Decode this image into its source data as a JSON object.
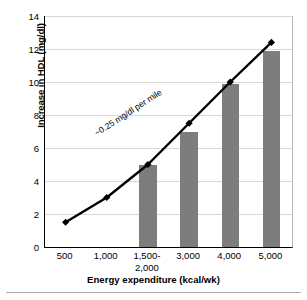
{
  "chart_data": {
    "type": "bar",
    "title": "",
    "subtitle": "",
    "xlabel": "Energy expenditure (kcal/wk)",
    "ylabel": "Increase in HDL (mg/dl)",
    "categories": [
      "500",
      "1,000",
      "1,500-\n2,000",
      "3,000",
      "4,000",
      "5,000"
    ],
    "ylim": [
      0,
      14
    ],
    "yticks": [
      0,
      2,
      4,
      6,
      8,
      10,
      12,
      14
    ],
    "ytick_labels": [
      "0",
      "2",
      "4",
      "6",
      "8",
      "10",
      "12",
      "14"
    ],
    "grid": true,
    "grid_axis": "y",
    "legend": "none",
    "series": [
      {
        "name": "Increase in HDL (bars)",
        "type": "bar",
        "color": "#7d7d7d",
        "values": [
          null,
          null,
          5.0,
          7.0,
          9.9,
          11.9
        ]
      },
      {
        "name": "~0.25 mg/dl per mile trend",
        "type": "line",
        "color": "#000000",
        "marker": "diamond",
        "values": [
          1.5,
          3.0,
          5.0,
          7.5,
          10.0,
          12.4
        ]
      }
    ],
    "annotations": [
      {
        "text": "~0.25 mg/dl per mile",
        "rotation_deg": -33,
        "x_category_index": 2,
        "y_value": 7.2
      }
    ]
  },
  "colors": {
    "bar_fill": "#7d7d7d",
    "line": "#000000",
    "gridline": "#d8d8d8",
    "axis": "#000000",
    "background": "#ffffff",
    "footer_rule": "#b0b0b0"
  }
}
